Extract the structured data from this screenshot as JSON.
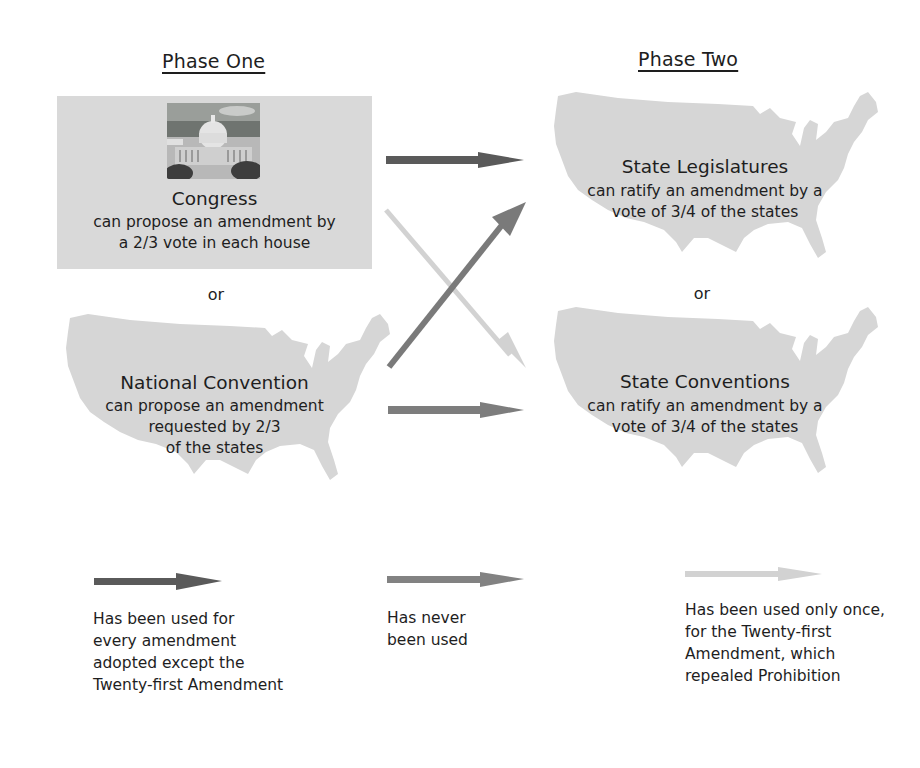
{
  "phases": {
    "one": {
      "title": "Phase One"
    },
    "two": {
      "title": "Phase Two"
    }
  },
  "proposal_methods": [
    {
      "title": "Congress",
      "description_lines": [
        "can propose an amendment by",
        "a 2/3 vote in each house"
      ],
      "image": "capitol-building-photo"
    },
    {
      "title": "National Convention",
      "description_lines": [
        "can propose an amendment",
        "requested by 2/3",
        "of the states"
      ],
      "image": "us-map-silhouette"
    }
  ],
  "ratification_methods": [
    {
      "title": "State Legislatures",
      "description_lines": [
        "can ratify an amendment by a",
        "vote of 3/4 of the states"
      ],
      "image": "us-map-silhouette"
    },
    {
      "title": "State Conventions",
      "description_lines": [
        "can ratify an amendment by a",
        "vote of 3/4 of the states"
      ],
      "image": "us-map-silhouette"
    }
  ],
  "connectors": {
    "or_left": "or",
    "or_right": "or"
  },
  "arrows": [
    {
      "from": "Congress",
      "to": "State Legislatures",
      "style": "dark"
    },
    {
      "from": "Congress",
      "to": "State Conventions",
      "style": "light"
    },
    {
      "from": "National Convention",
      "to": "State Legislatures",
      "style": "medium"
    },
    {
      "from": "National Convention",
      "to": "State Conventions",
      "style": "medium"
    }
  ],
  "legend": [
    {
      "style": "dark",
      "lines": [
        "Has been used for",
        "every amendment",
        "adopted except the",
        "Twenty-first Amendment"
      ]
    },
    {
      "style": "medium",
      "lines": [
        "Has never",
        "been used"
      ]
    },
    {
      "style": "light",
      "lines": [
        "Has been used only once,",
        "for the Twenty-first",
        "Amendment, which",
        "repealed Prohibition"
      ]
    }
  ],
  "colors": {
    "arrow_dark": "#5a5a5a",
    "arrow_medium": "#8a8a8a",
    "arrow_light": "#d2d2d2",
    "box_fill": "#d9d9d9",
    "map_fill": "#d6d6d6",
    "text": "#1e1e1e"
  }
}
